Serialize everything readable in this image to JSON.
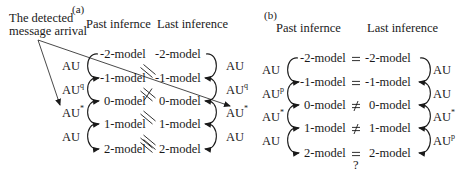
{
  "panel_a": {
    "label": "(a)",
    "annotation": "The detected message arrival",
    "annotation_line1": "The detected",
    "annotation_line2": "message arrival",
    "col_past": "Past infernce",
    "col_last": "Last inference",
    "past_models": [
      "-2-model",
      "-1-model",
      "0-model",
      "1-model",
      "2-model"
    ],
    "last_models": [
      "-2-model",
      "-1-model",
      "0-model",
      "1-model",
      "2-model"
    ],
    "relations": [
      "=",
      "=",
      "≠",
      "=",
      "="
    ],
    "past_arrows": [
      {
        "base": "AU",
        "sup": ""
      },
      {
        "base": "AU",
        "sup": "q"
      },
      {
        "base": "AU",
        "sup": "*"
      },
      {
        "base": "AU",
        "sup": ""
      }
    ],
    "last_arrows": [
      {
        "base": "AU",
        "sup": ""
      },
      {
        "base": "AU",
        "sup": "q"
      },
      {
        "base": "AU",
        "sup": "*"
      },
      {
        "base": "AU",
        "sup": ""
      }
    ]
  },
  "panel_b": {
    "label": "(b)",
    "col_past": "Past infernce",
    "col_last": "Last inference",
    "past_models": [
      "-2-model",
      "-1-model",
      "0-model",
      "1-model",
      "2-model"
    ],
    "last_models": [
      "-2-model",
      "-1-model",
      "0-model",
      "1-model",
      "2-model"
    ],
    "relations": [
      "=",
      "=",
      "≠",
      "≠",
      "="
    ],
    "relation_query": "?",
    "past_arrows": [
      {
        "base": "AU",
        "sup": ""
      },
      {
        "base": "AU",
        "sup": "p"
      },
      {
        "base": "AU",
        "sup": "*"
      },
      {
        "base": "AU",
        "sup": ""
      }
    ],
    "last_arrows": [
      {
        "base": "AU",
        "sup": ""
      },
      {
        "base": "AU",
        "sup": ""
      },
      {
        "base": "AU",
        "sup": "*"
      },
      {
        "base": "AU",
        "sup": "p"
      }
    ]
  }
}
